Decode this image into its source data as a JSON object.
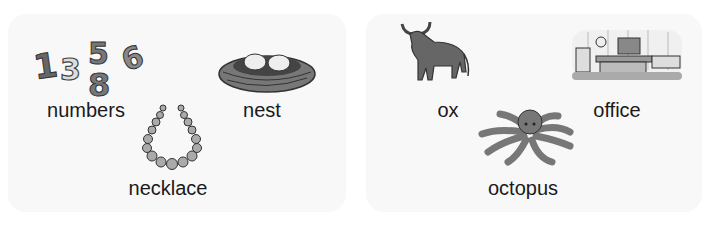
{
  "panels": [
    {
      "id": "left",
      "items": [
        {
          "word": "numbers",
          "icon": "numbers-icon",
          "digits": [
            "1",
            "3",
            "5",
            "8",
            "6"
          ]
        },
        {
          "word": "nest",
          "icon": "nest-icon"
        },
        {
          "word": "necklace",
          "icon": "necklace-icon"
        }
      ]
    },
    {
      "id": "right",
      "items": [
        {
          "word": "ox",
          "icon": "ox-icon"
        },
        {
          "word": "office",
          "icon": "office-icon"
        },
        {
          "word": "octopus",
          "icon": "octopus-icon"
        }
      ]
    }
  ],
  "colors": {
    "panel": "#f8f8f8",
    "illustration": "#6e6e6e",
    "text": "#1a1a1a"
  }
}
